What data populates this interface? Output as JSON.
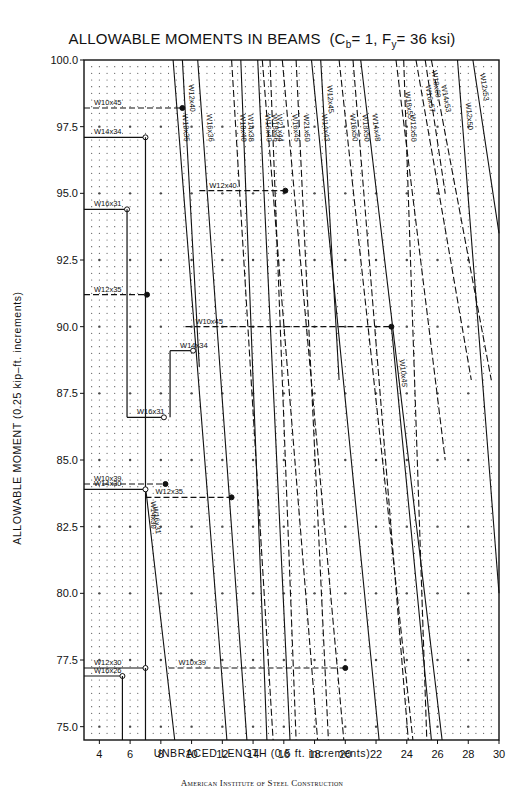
{
  "chart_data": {
    "type": "line",
    "title": "ALLOWABLE MOMENTS IN BEAMS",
    "title_params": {
      "prefix": "(C",
      "cb_sub": "b",
      "mid": "= 1, F",
      "fy_sub": "y",
      "suffix": "= 36 ksi)"
    },
    "xlabel": "UNBRACED LENGTH  (0.5 ft. increments)",
    "ylabel": "ALLOWABLE MOMENT  (0.25 kip–ft. increments)",
    "footer": "American Institute of Steel Construction",
    "xlim": [
      3,
      30
    ],
    "ylim": [
      74.5,
      100
    ],
    "x_ticks": [
      4,
      6,
      8,
      10,
      12,
      14,
      16,
      18,
      20,
      22,
      24,
      26,
      28,
      30
    ],
    "y_ticks": [
      75.0,
      77.5,
      80.0,
      82.5,
      85.0,
      87.5,
      90.0,
      92.5,
      95.0,
      97.5,
      100.0
    ],
    "grid": "dotted 0.5 ft x 0.25 kip-ft",
    "series": [
      {
        "name": "W18x35",
        "style": "solid",
        "points": [
          [
            8.8,
            100
          ],
          [
            12.3,
            74.5
          ]
        ]
      },
      {
        "name": "W12x40",
        "style": "solid",
        "points": [
          [
            9.4,
            100
          ],
          [
            10.5,
            88.5
          ]
        ]
      },
      {
        "name": "W16x36",
        "style": "solid",
        "points": [
          [
            10.4,
            100
          ],
          [
            13.6,
            74.5
          ]
        ]
      },
      {
        "name": "W18x40",
        "style": "dashed",
        "points": [
          [
            12.6,
            100
          ],
          [
            15.3,
            74.5
          ]
        ]
      },
      {
        "name": "W14x38",
        "style": "solid",
        "points": [
          [
            13.2,
            100
          ],
          [
            14.9,
            74.5
          ]
        ]
      },
      {
        "name": "W16x40",
        "style": "solid",
        "points": [
          [
            14.3,
            100
          ],
          [
            16.4,
            74.5
          ]
        ]
      },
      {
        "name": "W18x46",
        "style": "dashed",
        "points": [
          [
            14.6,
            100
          ],
          [
            18.2,
            74.5
          ]
        ]
      },
      {
        "name": "W21x44",
        "style": "dashed",
        "points": [
          [
            15.1,
            100
          ],
          [
            16.8,
            74.5
          ]
        ]
      },
      {
        "name": "W16x45",
        "style": "dashed",
        "points": [
          [
            15.9,
            100
          ],
          [
            19.9,
            74.5
          ]
        ]
      },
      {
        "name": "W21x50",
        "style": "dashed",
        "points": [
          [
            16.8,
            100
          ],
          [
            18.9,
            74.5
          ]
        ]
      },
      {
        "name": "W12x45",
        "style": "solid",
        "points": [
          [
            18.4,
            100
          ],
          [
            19.6,
            88
          ]
        ]
      },
      {
        "name": "W14x43",
        "style": "solid",
        "points": [
          [
            17.8,
            100
          ],
          [
            22.2,
            74.5
          ]
        ]
      },
      {
        "name": "W18x50",
        "style": "dashed",
        "points": [
          [
            20.5,
            100
          ],
          [
            24.1,
            74.5
          ]
        ]
      },
      {
        "name": "W16x50",
        "style": "dashed",
        "points": [
          [
            19.6,
            100
          ],
          [
            24.4,
            74.5
          ]
        ]
      },
      {
        "name": "W14x48",
        "style": "solid",
        "points": [
          [
            21.0,
            100
          ],
          [
            26.3,
            74.5
          ]
        ]
      },
      {
        "name": "W12x50",
        "style": "dashed",
        "points": [
          [
            23.8,
            100
          ],
          [
            25.3,
            74.5
          ]
        ]
      },
      {
        "name": "W18x55",
        "style": "dashed",
        "points": [
          [
            23.3,
            100
          ],
          [
            26.5,
            85
          ]
        ]
      },
      {
        "name": "W16x57",
        "style": "dashed",
        "points": [
          [
            24.6,
            100
          ],
          [
            28.2,
            88
          ]
        ]
      },
      {
        "name": "W14x53",
        "style": "dashed",
        "points": [
          [
            25.6,
            100
          ],
          [
            29.5,
            88
          ]
        ]
      },
      {
        "name": "W18x60",
        "style": "dashed",
        "points": [
          [
            25.2,
            100
          ],
          [
            26.5,
            95
          ]
        ]
      },
      {
        "name": "W12x53",
        "style": "solid",
        "points": [
          [
            28.3,
            100
          ],
          [
            30,
            93.5
          ]
        ]
      },
      {
        "name": "W10x45",
        "style": "solid",
        "points": [
          [
            23.0,
            90
          ],
          [
            25.6,
            74.5
          ]
        ]
      },
      {
        "name": "W12x50 (lower)",
        "style": "solid",
        "points": [
          [
            27.3,
            100
          ],
          [
            30,
            80
          ]
        ]
      },
      {
        "name": "W16x31",
        "style": "solid",
        "points": [
          [
            7.0,
            84
          ],
          [
            8.9,
            74.5
          ]
        ]
      },
      {
        "name": "W14x30",
        "style": "solid",
        "points": [
          [
            7.0,
            84
          ],
          [
            7.0,
            77.2
          ]
        ]
      }
    ],
    "steps": [
      {
        "name": "W10x45",
        "style": "dashed",
        "y": 98.2,
        "x": [
          3,
          9.4
        ]
      },
      {
        "name": "W14x34",
        "style": "solid",
        "y": 97.1,
        "x": [
          3,
          7.0
        ]
      },
      {
        "name": "W16x31",
        "style": "solid",
        "y": 94.4,
        "x": [
          3,
          5.8
        ]
      },
      {
        "name": "W12x35",
        "style": "dashed",
        "y": 91.2,
        "x": [
          3,
          7.1
        ]
      },
      {
        "name": "W10x45",
        "style": "dashed",
        "y": 90.0,
        "x": [
          9.6,
          23.0
        ]
      },
      {
        "name": "W14x34",
        "style": "solid",
        "y": 89.1,
        "x": [
          8.6,
          10.1
        ]
      },
      {
        "name": "W12x40",
        "style": "dashed",
        "y": 95.1,
        "x": [
          10.5,
          16.1
        ]
      },
      {
        "name": "W16x31",
        "style": "solid",
        "y": 86.6,
        "x": [
          5.8,
          8.2
        ]
      },
      {
        "name": "W10x39",
        "style": "dashed",
        "y": 84.1,
        "x": [
          3,
          8.3
        ]
      },
      {
        "name": "W14x30",
        "style": "solid",
        "y": 83.9,
        "x": [
          3,
          7.0
        ]
      },
      {
        "name": "W12x35",
        "style": "dashed",
        "y": 83.6,
        "x": [
          7.0,
          12.6
        ]
      },
      {
        "name": "W12x30",
        "style": "solid",
        "y": 77.2,
        "x": [
          3,
          7.0
        ]
      },
      {
        "name": "W10x39",
        "style": "dashed",
        "y": 77.2,
        "x": [
          8.5,
          20.0
        ]
      },
      {
        "name": "W16x26",
        "style": "solid",
        "y": 76.9,
        "x": [
          3,
          5.5
        ]
      }
    ]
  }
}
